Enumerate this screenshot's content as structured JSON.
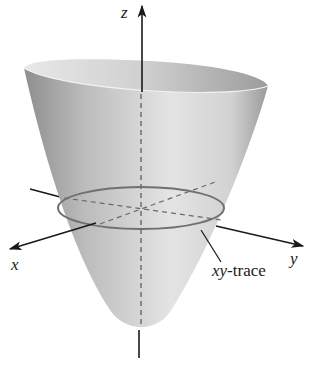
{
  "figure": {
    "type": "3d-surface-illustration",
    "surface": "elliptic paraboloid (bowl opening upward)",
    "axes": {
      "z_label": "z",
      "x_label": "x",
      "y_label": "y"
    },
    "annotation": {
      "trace_label_var": "xy",
      "trace_label_suffix": "-trace"
    },
    "colors": {
      "surface_light": "#e6e6e6",
      "surface_dark": "#8f8f8f",
      "rim_inner": "#bdbdbd",
      "trace_line": "#6e6e6e",
      "axis": "#1a1a1a",
      "background": "#ffffff"
    }
  }
}
